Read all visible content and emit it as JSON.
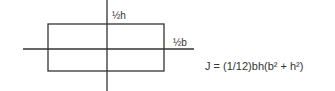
{
  "diagram": {
    "labels": {
      "half_h": "½h",
      "half_b": "½b"
    },
    "formula": "J = (1/12)bh(b² + h²)",
    "colors": {
      "stroke": "#333333",
      "background": "#ffffff"
    }
  }
}
